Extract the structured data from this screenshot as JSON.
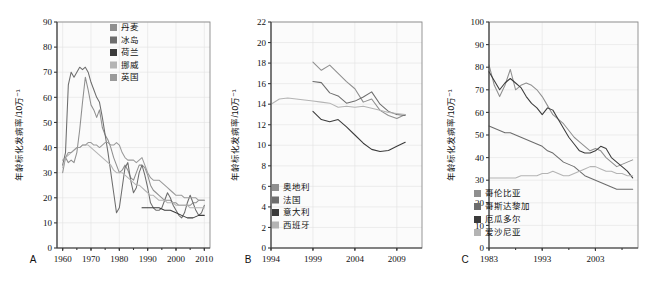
{
  "figure": {
    "background": "#ffffff",
    "panel_count": 3
  },
  "chart_data": [
    {
      "type": "line",
      "panel_letter": "A",
      "title": "",
      "xlabel": "",
      "ylabel": "年龄标化发病率/10万⁻¹",
      "xlim": [
        1958,
        2012
      ],
      "ylim": [
        0,
        90
      ],
      "xticks": [
        "1960",
        "1970",
        "1980",
        "1990",
        "2000",
        "2010"
      ],
      "xtick_values": [
        1960,
        1970,
        1980,
        1990,
        2000,
        2010
      ],
      "yticks": [
        "0",
        "10",
        "20",
        "30",
        "40",
        "50",
        "60",
        "70",
        "80",
        "90"
      ],
      "ytick_values": [
        0,
        10,
        20,
        30,
        40,
        50,
        60,
        70,
        80,
        90
      ],
      "grid": true,
      "legend_position": "top-center",
      "series": [
        {
          "name": "丹麦",
          "color": "#8f8f8f",
          "x": [
            1960,
            1961,
            1962,
            1963,
            1964,
            1965,
            1966,
            1967,
            1968,
            1969,
            1970,
            1971,
            1972,
            1973,
            1974,
            1975,
            1976,
            1977,
            1978,
            1979,
            1980,
            1981,
            1982,
            1983,
            1984,
            1985,
            1986,
            1987,
            1988,
            1989,
            1990,
            1991,
            1992,
            1993,
            1994,
            1995,
            1996,
            1997,
            1998,
            1999,
            2000,
            2001,
            2002,
            2003,
            2004,
            2005,
            2006,
            2007,
            2008,
            2009,
            2010
          ],
          "values": [
            30,
            36,
            34,
            35,
            34,
            38,
            47,
            58,
            68,
            63,
            57,
            55,
            52,
            55,
            48,
            45,
            43,
            40,
            36,
            33,
            30,
            31,
            33,
            31,
            28,
            27,
            30,
            33,
            33,
            32,
            29,
            25,
            23,
            22,
            21,
            20,
            19,
            19,
            19,
            18,
            18,
            17,
            17,
            17,
            17,
            17,
            18,
            18,
            19,
            19,
            19
          ]
        },
        {
          "name": "冰岛",
          "color": "#6d6d6d",
          "x": [
            1960,
            1961,
            1962,
            1963,
            1964,
            1965,
            1966,
            1967,
            1968,
            1969,
            1970,
            1971,
            1972,
            1973,
            1974,
            1975,
            1976,
            1977,
            1978,
            1979,
            1980,
            1981,
            1982,
            1983,
            1984,
            1985,
            1986,
            1987,
            1988,
            1989,
            1990,
            1991,
            1992,
            1993,
            1994,
            1995,
            1996,
            1997,
            1998,
            1999,
            2000,
            2001,
            2002,
            2003,
            2004,
            2005,
            2006,
            2007,
            2008,
            2009,
            2010
          ],
          "values": [
            33,
            38,
            65,
            70,
            68,
            70,
            72,
            71,
            72,
            70,
            66,
            63,
            60,
            58,
            52,
            45,
            38,
            30,
            22,
            14,
            16,
            24,
            32,
            34,
            27,
            22,
            24,
            30,
            33,
            29,
            24,
            18,
            16,
            15,
            15,
            16,
            19,
            22,
            20,
            17,
            15,
            13,
            12,
            14,
            18,
            21,
            18,
            15,
            13,
            14,
            17
          ]
        },
        {
          "name": "荷兰",
          "color": "#3b3b3b",
          "x": [
            1960,
            1965,
            1970,
            1975,
            1980,
            1985,
            1988,
            1990,
            1992,
            1994,
            1996,
            1998,
            2000,
            2002,
            2004,
            2006,
            2008,
            2010
          ],
          "values": [
            null,
            null,
            null,
            null,
            null,
            null,
            16,
            16,
            16,
            16,
            15,
            15,
            14,
            13,
            12,
            12,
            13,
            13
          ]
        },
        {
          "name": "挪威",
          "color": "#b4b4b4",
          "x": [
            1960,
            1961,
            1962,
            1963,
            1964,
            1965,
            1966,
            1967,
            1968,
            1969,
            1970,
            1971,
            1972,
            1973,
            1974,
            1975,
            1976,
            1977,
            1978,
            1979,
            1980,
            1981,
            1982,
            1983,
            1984,
            1985,
            1986,
            1987,
            1988,
            1989,
            1990,
            1991,
            1992,
            1993,
            1994,
            1995,
            1996,
            1997,
            1998,
            1999,
            2000,
            2001,
            2002,
            2003,
            2004,
            2005,
            2006,
            2007,
            2008,
            2009,
            2010
          ],
          "values": [
            32,
            36,
            37,
            38,
            39,
            40,
            40,
            41,
            41,
            41,
            40,
            39,
            38,
            37,
            36,
            35,
            34,
            33,
            31,
            30,
            30,
            30,
            29,
            28,
            27,
            26,
            25,
            25,
            24,
            23,
            22,
            21,
            21,
            20,
            19,
            19,
            19,
            18,
            18,
            18,
            17,
            17,
            17,
            17,
            17,
            16,
            16,
            16,
            16,
            16,
            16
          ]
        },
        {
          "name": "英国",
          "color": "#9a9a9a",
          "x": [
            1960,
            1961,
            1962,
            1963,
            1964,
            1965,
            1966,
            1967,
            1968,
            1969,
            1970,
            1971,
            1972,
            1973,
            1974,
            1975,
            1976,
            1977,
            1978,
            1979,
            1980,
            1981,
            1982,
            1983,
            1984,
            1985,
            1986,
            1987,
            1988,
            1989,
            1990,
            1991,
            1992,
            1993,
            1994,
            1995,
            1996,
            1997,
            1998,
            1999,
            2000,
            2001,
            2002,
            2003,
            2004,
            2005,
            2006,
            2007,
            2008,
            2009,
            2010
          ],
          "values": [
            35,
            36,
            38,
            38,
            39,
            40,
            40,
            41,
            41,
            42,
            42,
            41,
            41,
            40,
            41,
            42,
            42,
            41,
            41,
            42,
            41,
            38,
            36,
            35,
            35,
            35,
            34,
            35,
            36,
            33,
            30,
            28,
            27,
            27,
            27,
            26,
            25,
            24,
            23,
            22,
            21,
            21,
            21,
            20,
            20,
            20,
            20,
            20,
            19,
            19,
            19
          ]
        }
      ]
    },
    {
      "type": "line",
      "panel_letter": "B",
      "title": "",
      "xlabel": "",
      "ylabel": "年龄标化发病率/10万⁻¹",
      "xlim": [
        1994,
        2012
      ],
      "ylim": [
        0,
        22
      ],
      "xticks": [
        "1994",
        "1999",
        "2004",
        "2009"
      ],
      "xtick_values": [
        1994,
        1999,
        2004,
        2009
      ],
      "yticks": [
        "0",
        "2",
        "4",
        "6",
        "8",
        "10",
        "12",
        "14",
        "16",
        "18",
        "20",
        "22"
      ],
      "ytick_values": [
        0,
        2,
        4,
        6,
        8,
        10,
        12,
        14,
        16,
        18,
        20,
        22
      ],
      "grid": true,
      "legend_position": "bottom-left",
      "series": [
        {
          "name": "奥地利",
          "color": "#8f8f8f",
          "x": [
            1999,
            2000,
            2001,
            2002,
            2003,
            2004,
            2005,
            2006,
            2007,
            2008,
            2009,
            2010
          ],
          "values": [
            18.1,
            17.3,
            17.8,
            17.0,
            16.2,
            15.5,
            14.2,
            14.5,
            13.4,
            12.9,
            12.6,
            13.0
          ]
        },
        {
          "name": "法国",
          "color": "#6d6d6d",
          "x": [
            1999,
            2000,
            2001,
            2002,
            2003,
            2004,
            2005,
            2006,
            2007,
            2008,
            2009,
            2010
          ],
          "values": [
            16.2,
            16.1,
            15.1,
            14.8,
            14.1,
            14.3,
            14.7,
            15.2,
            14.0,
            13.3,
            13.0,
            12.9
          ]
        },
        {
          "name": "意大利",
          "color": "#3b3b3b",
          "x": [
            1999,
            2000,
            2001,
            2002,
            2003,
            2004,
            2005,
            2006,
            2007,
            2008,
            2009,
            2010
          ],
          "values": [
            13.3,
            12.5,
            12.3,
            12.5,
            11.8,
            11.0,
            10.2,
            9.6,
            9.4,
            9.5,
            9.9,
            10.3
          ]
        },
        {
          "name": "西班牙",
          "color": "#b4b4b4",
          "x": [
            1994,
            1995,
            1996,
            1997,
            1998,
            1999,
            2000,
            2001,
            2002,
            2003,
            2004,
            2005,
            2006,
            2007,
            2008,
            2009,
            2010
          ],
          "values": [
            14.0,
            14.5,
            14.6,
            14.5,
            14.4,
            14.3,
            14.2,
            14.1,
            13.7,
            13.8,
            13.7,
            13.8,
            13.6,
            13.4,
            13.2,
            13.1,
            13.0
          ]
        }
      ]
    },
    {
      "type": "line",
      "panel_letter": "C",
      "title": "",
      "xlabel": "",
      "ylabel": "年龄标化发病率/10万⁻¹",
      "xlim": [
        1983,
        2011
      ],
      "ylim": [
        0,
        100
      ],
      "xticks": [
        "1983",
        "1993",
        "2003"
      ],
      "xtick_values": [
        1983,
        1993,
        2003
      ],
      "yticks": [
        "0",
        "10",
        "20",
        "30",
        "40",
        "50",
        "60",
        "70",
        "80",
        "90",
        "100"
      ],
      "ytick_values": [
        0,
        10,
        20,
        30,
        40,
        50,
        60,
        70,
        80,
        90,
        100
      ],
      "grid": true,
      "legend_position": "bottom-left",
      "series": [
        {
          "name": "哥伦比亚",
          "color": "#8f8f8f",
          "x": [
            1983,
            1984,
            1985,
            1986,
            1987,
            1988,
            1989,
            1990,
            1991,
            1992,
            1993,
            1994,
            1995,
            1996,
            1997,
            1998,
            1999,
            2000,
            2001,
            2002,
            2003,
            2004,
            2005,
            2006,
            2007,
            2008,
            2009,
            2010
          ],
          "values": [
            81,
            72,
            67,
            72,
            79,
            70,
            72,
            73,
            72,
            70,
            67,
            63,
            59,
            57,
            55,
            52,
            49,
            47,
            45,
            43,
            44,
            43,
            40,
            38,
            36,
            37,
            38,
            39
          ]
        },
        {
          "name": "哥斯达黎加",
          "color": "#6d6d6d",
          "x": [
            1983,
            1984,
            1985,
            1986,
            1987,
            1988,
            1989,
            1990,
            1991,
            1992,
            1993,
            1994,
            1995,
            1996,
            1997,
            1998,
            1999,
            2000,
            2001,
            2002,
            2003,
            2004,
            2005,
            2006,
            2007,
            2008,
            2009,
            2010
          ],
          "values": [
            54,
            53,
            52,
            51,
            51,
            50,
            49,
            48,
            47,
            46,
            45,
            43,
            42,
            40,
            38,
            37,
            36,
            34,
            32,
            31,
            30,
            29,
            28,
            27,
            26,
            26,
            26,
            26
          ]
        },
        {
          "name": "厄瓜多尔",
          "color": "#3b3b3b",
          "x": [
            1983,
            1984,
            1985,
            1986,
            1987,
            1988,
            1989,
            1990,
            1991,
            1992,
            1993,
            1994,
            1995,
            1996,
            1997,
            1998,
            1999,
            2000,
            2001,
            2002,
            2003,
            2004,
            2005,
            2006,
            2007,
            2008,
            2009,
            2010
          ],
          "values": [
            78,
            74,
            70,
            73,
            75,
            73,
            71,
            67,
            64,
            62,
            59,
            62,
            61,
            57,
            53,
            49,
            46,
            43,
            42,
            42,
            43,
            45,
            44,
            40,
            38,
            36,
            34,
            31
          ]
        },
        {
          "name": "爱沙尼亚",
          "color": "#b4b4b4",
          "x": [
            1983,
            1984,
            1985,
            1986,
            1987,
            1988,
            1989,
            1990,
            1991,
            1992,
            1993,
            1994,
            1995,
            1996,
            1997,
            1998,
            1999,
            2000,
            2001,
            2002,
            2003,
            2004,
            2005,
            2006,
            2007,
            2008,
            2009,
            2010
          ],
          "values": [
            31,
            31,
            31,
            31,
            31,
            31,
            32,
            32,
            32,
            32,
            33,
            33,
            34,
            33,
            32,
            32,
            33,
            34,
            35,
            36,
            36,
            35,
            34,
            34,
            33,
            33,
            32,
            32
          ]
        }
      ]
    }
  ]
}
